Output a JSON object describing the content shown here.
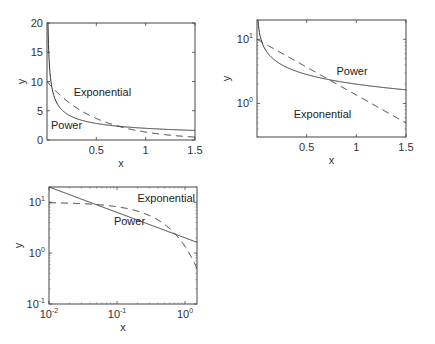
{
  "chart_data": [
    {
      "type": "line",
      "panel": "top-left",
      "xscale": "linear",
      "yscale": "linear",
      "xlabel": "x",
      "ylabel": "y",
      "xlim": [
        0,
        1.5
      ],
      "ylim": [
        0,
        20
      ],
      "xticks": [
        0.5,
        1,
        1.5
      ],
      "xtick_labels": [
        "0.5",
        "1",
        "1.5"
      ],
      "yticks": [
        0,
        5,
        10,
        15,
        20
      ],
      "ytick_labels": [
        "0",
        "5",
        "10",
        "15",
        "20"
      ],
      "grid": false,
      "series": [
        {
          "name": "Power",
          "formula": "y = 2*x^(-1/2)",
          "style": "solid",
          "x": [
            0.01,
            0.02,
            0.05,
            0.1,
            0.2,
            0.3,
            0.5,
            0.75,
            1.0,
            1.25,
            1.5
          ],
          "y": [
            20,
            14.14,
            8.94,
            6.32,
            4.47,
            3.65,
            2.83,
            2.31,
            2.0,
            1.79,
            1.63
          ]
        },
        {
          "name": "Exponential",
          "formula": "y = 10*exp(-2x)",
          "style": "dashed",
          "x": [
            0,
            0.1,
            0.2,
            0.3,
            0.5,
            0.75,
            1.0,
            1.25,
            1.5
          ],
          "y": [
            10,
            8.19,
            6.7,
            5.49,
            3.68,
            2.23,
            1.35,
            0.82,
            0.5
          ]
        }
      ],
      "annotations": [
        {
          "text": "Exponential",
          "x": 0.27,
          "y": 7.5
        },
        {
          "text": "Power",
          "x": 0.04,
          "y": 1.8
        }
      ]
    },
    {
      "type": "line",
      "panel": "top-right",
      "xscale": "linear",
      "yscale": "log",
      "xlabel": "x",
      "ylabel": "y",
      "xlim": [
        0,
        1.5
      ],
      "ylim": [
        0.3,
        20
      ],
      "xticks": [
        0.5,
        1,
        1.5
      ],
      "xtick_labels": [
        "0.5",
        "1",
        "1.5"
      ],
      "yticks": [
        1,
        10
      ],
      "ytick_labels": [
        "10^0",
        "10^1"
      ],
      "grid": false,
      "series": [
        {
          "name": "Power",
          "formula": "y = 2*x^(-1/2)",
          "style": "solid"
        },
        {
          "name": "Exponential",
          "formula": "y = 10*exp(-2x)",
          "style": "dashed"
        }
      ],
      "annotations": [
        {
          "text": "Power",
          "x": 0.8,
          "y": 2.8
        },
        {
          "text": "Exponential",
          "x": 0.37,
          "y": 0.6
        }
      ]
    },
    {
      "type": "line",
      "panel": "bottom-left",
      "xscale": "log",
      "yscale": "log",
      "xlabel": "x",
      "ylabel": "y",
      "xlim": [
        0.01,
        1.5
      ],
      "ylim": [
        0.1,
        20
      ],
      "xticks": [
        0.01,
        0.1,
        1
      ],
      "xtick_labels": [
        "10^-2",
        "10^-1",
        "10^0"
      ],
      "yticks": [
        0.1,
        1,
        10
      ],
      "ytick_labels": [
        "10^-1",
        "10^0",
        "10^1"
      ],
      "grid": false,
      "series": [
        {
          "name": "Power",
          "formula": "y = 2*x^(-1/2)",
          "style": "solid"
        },
        {
          "name": "Exponential",
          "formula": "y = 10*exp(-2x)",
          "style": "dashed"
        }
      ],
      "annotations": [
        {
          "text": "Exponential",
          "x": 0.2,
          "y": 10
        },
        {
          "text": "Power",
          "x": 0.09,
          "y": 3.5
        }
      ]
    }
  ],
  "labels": {
    "x": "x",
    "y": "y",
    "power": "Power",
    "exponential": "Exponential"
  }
}
